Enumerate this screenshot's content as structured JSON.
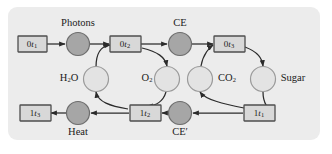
{
  "diagram": {
    "background_color": "#ececec",
    "node_fill": "#d8d8d8",
    "dark_circle_fill": "#a6a6a6",
    "light_circle_fill": "#e3e3e3",
    "edge_color": "#2b2b2b",
    "transitions": [
      {
        "id": "t0_1",
        "prefix": "0",
        "symbol": "t",
        "sub": "1",
        "x": 32,
        "y": 44,
        "label": "0t1"
      },
      {
        "id": "t0_2",
        "prefix": "0",
        "symbol": "t",
        "sub": "2",
        "x": 125,
        "y": 44,
        "label": "0t2"
      },
      {
        "id": "t0_3",
        "prefix": "0",
        "symbol": "t",
        "sub": "3",
        "x": 229,
        "y": 44,
        "label": "0t3"
      },
      {
        "id": "t1_3",
        "prefix": "1",
        "symbol": "t",
        "sub": "3",
        "x": 35,
        "y": 113,
        "label": "1t3"
      },
      {
        "id": "t1_2",
        "prefix": "1",
        "symbol": "t",
        "sub": "2",
        "x": 145,
        "y": 113,
        "label": "1t2"
      },
      {
        "id": "t1_1",
        "prefix": "1",
        "symbol": "t",
        "sub": "1",
        "x": 259,
        "y": 113,
        "label": "1t1"
      }
    ],
    "dark_places": [
      {
        "id": "photons",
        "label": "Photons",
        "x": 78,
        "y": 44,
        "label_x": 78,
        "label_y": 25
      },
      {
        "id": "ce",
        "label": "CE",
        "x": 180,
        "y": 44,
        "label_x": 180,
        "label_y": 25
      },
      {
        "id": "heat",
        "label": "Heat",
        "x": 78,
        "y": 113,
        "label_x": 78,
        "label_y": 132
      },
      {
        "id": "ce_prime",
        "label": "CE′",
        "x": 180,
        "y": 113,
        "label_x": 180,
        "label_y": 132
      }
    ],
    "light_places": [
      {
        "id": "h2o",
        "base": "H",
        "sub": "2",
        "tail": "O",
        "x": 96,
        "y": 79,
        "label_x": 70,
        "label_y": 79,
        "label": "H2O"
      },
      {
        "id": "o2",
        "base": "O",
        "sub": "2",
        "tail": "",
        "x": 167,
        "y": 79,
        "label_x": 146,
        "label_y": 79,
        "label": "O2"
      },
      {
        "id": "co2",
        "base": "CO",
        "sub": "2",
        "tail": "",
        "x": 200,
        "y": 79,
        "label_x": 226,
        "label_y": 79,
        "label": "CO2"
      },
      {
        "id": "sugar",
        "base": "Sugar",
        "sub": "",
        "tail": "",
        "x": 263,
        "y": 79,
        "label_x": 291,
        "label_y": 79,
        "label": "Sugar"
      }
    ],
    "edges": [
      {
        "from": "0t1",
        "to": "photons",
        "kind": "straight"
      },
      {
        "from": "photons",
        "to": "0t2",
        "kind": "straight"
      },
      {
        "from": "0t2",
        "to": "ce",
        "kind": "straight"
      },
      {
        "from": "ce",
        "to": "0t3",
        "kind": "straight"
      },
      {
        "from": "h2o",
        "to": "0t2",
        "kind": "curved"
      },
      {
        "from": "0t2",
        "to": "o2",
        "kind": "curved"
      },
      {
        "from": "co2",
        "to": "0t3",
        "kind": "curved"
      },
      {
        "from": "0t3",
        "to": "sugar",
        "kind": "curved"
      },
      {
        "from": "1t1",
        "to": "ce_prime",
        "kind": "straight"
      },
      {
        "from": "ce_prime",
        "to": "1t2",
        "kind": "straight"
      },
      {
        "from": "1t2",
        "to": "heat",
        "kind": "straight"
      },
      {
        "from": "heat",
        "to": "1t3",
        "kind": "straight"
      },
      {
        "from": "sugar",
        "to": "1t1",
        "kind": "curved"
      },
      {
        "from": "1t1",
        "to": "co2",
        "kind": "curved"
      },
      {
        "from": "o2",
        "to": "1t2",
        "kind": "curved"
      },
      {
        "from": "1t2",
        "to": "h2o",
        "kind": "curved"
      }
    ]
  }
}
